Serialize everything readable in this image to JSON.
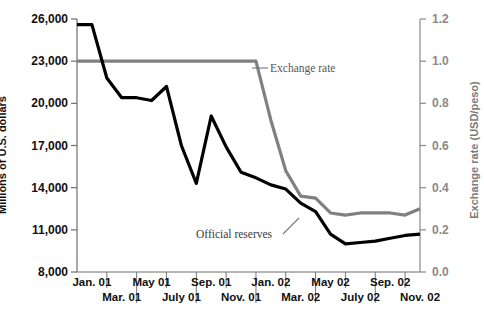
{
  "chart_data": {
    "type": "line",
    "title": "",
    "xlabel": "",
    "ylabel": "Millions of U.S. dollars",
    "y2label": "Exchange rate (USD/peso)",
    "grid": false,
    "legend_position": "inline-annotations",
    "x": [
      "Jan. 01",
      "Feb. 01",
      "Mar. 01",
      "Apr. 01",
      "May 01",
      "June 01",
      "July 01",
      "Aug. 01",
      "Sep. 01",
      "Oct. 01",
      "Nov. 01",
      "Dec. 01",
      "Jan. 02",
      "Feb. 02",
      "Mar. 02",
      "Apr. 02",
      "May 02",
      "June 02",
      "July 02",
      "Aug. 02",
      "Sep. 02",
      "Oct. 02",
      "Nov. 02",
      "Dec. 02"
    ],
    "xticklabels_row1": [
      "Jan. 01",
      "May 01",
      "Sep. 01",
      "Jan. 02",
      "May 02",
      "Sep. 02"
    ],
    "xticklabels_row2": [
      "Mar. 01",
      "July 01",
      "Nov. 01",
      "Mar. 02",
      "July 02",
      "Nov. 02"
    ],
    "ylim": [
      8000,
      26000
    ],
    "yticks": [
      8000,
      11000,
      14000,
      17000,
      20000,
      23000,
      26000
    ],
    "yticklabels": [
      "8,000",
      "11,000",
      "14,000",
      "17,000",
      "20,000",
      "23,000",
      "26,000"
    ],
    "y2lim": [
      0.0,
      1.2
    ],
    "y2ticks": [
      0.0,
      0.2,
      0.4,
      0.6,
      0.8,
      1.0,
      1.2
    ],
    "y2ticklabels": [
      "0.0",
      "0.2",
      "0.4",
      "0.6",
      "0.8",
      "1.0",
      "1.2"
    ],
    "series": [
      {
        "name": "Official reserves",
        "axis": "left",
        "color": "#000000",
        "values": [
          25600,
          25600,
          21800,
          20400,
          20400,
          20200,
          21200,
          17000,
          14300,
          19100,
          16900,
          15100,
          14700,
          14200,
          13900,
          12900,
          12300,
          10700,
          10000,
          10100,
          10200,
          10400,
          10600,
          10700
        ]
      },
      {
        "name": "Exchange rate",
        "axis": "right",
        "color": "#808080",
        "values": [
          1.0,
          1.0,
          1.0,
          1.0,
          1.0,
          1.0,
          1.0,
          1.0,
          1.0,
          1.0,
          1.0,
          1.0,
          1.0,
          0.72,
          0.48,
          0.36,
          0.35,
          0.28,
          0.27,
          0.28,
          0.28,
          0.28,
          0.27,
          0.3
        ]
      }
    ],
    "annotations": [
      {
        "name": "Exchange rate",
        "text": "Exchange rate"
      },
      {
        "name": "Official reserves",
        "text": "Official reserves"
      }
    ]
  },
  "colors": {
    "reserves_line": "#000000",
    "exchange_line": "#808080",
    "axis_left": "#111111",
    "axis_right": "#8a8a8a",
    "background": "#ffffff"
  }
}
